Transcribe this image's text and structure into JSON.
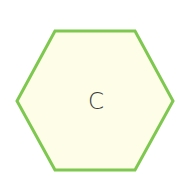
{
  "shape": {
    "type": "hexagon",
    "label": "C",
    "fill_color": "#fdfde8",
    "stroke_color": "#7ec850"
  }
}
